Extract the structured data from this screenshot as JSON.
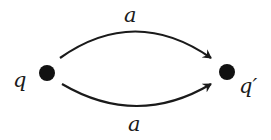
{
  "diagram": {
    "type": "transition-graph",
    "nodes": [
      {
        "id": "q",
        "label": "q"
      },
      {
        "id": "q_prime",
        "label": "q′"
      }
    ],
    "edges": [
      {
        "from": "q",
        "to": "q_prime",
        "label": "a",
        "position": "upper"
      },
      {
        "from": "q",
        "to": "q_prime",
        "label": "a",
        "position": "lower"
      }
    ],
    "colors": {
      "stroke": "#1a1a1a",
      "node_fill": "#111111",
      "background": "#ffffff"
    }
  }
}
